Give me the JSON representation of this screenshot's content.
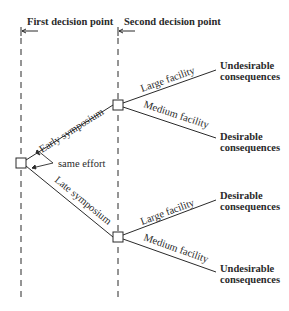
{
  "headers": {
    "first": "First decision point",
    "second": "Second decision point"
  },
  "root": {
    "annotation": "same effort",
    "branches": [
      {
        "label": "Early symposium",
        "facilities": [
          {
            "label": "Large facility",
            "outcome_line1": "Undesirable",
            "outcome_line2": "consequences"
          },
          {
            "label": "Medium facility",
            "outcome_line1": "Desirable",
            "outcome_line2": "consequences"
          }
        ]
      },
      {
        "label": "Late symposium",
        "facilities": [
          {
            "label": "Large facility",
            "outcome_line1": "Desirable",
            "outcome_line2": "consequences"
          },
          {
            "label": "Medium facility",
            "outcome_line1": "Undesirable",
            "outcome_line2": "consequences"
          }
        ]
      }
    ]
  },
  "colors": {
    "ink": "#2a2a2a",
    "background": "#ffffff"
  }
}
